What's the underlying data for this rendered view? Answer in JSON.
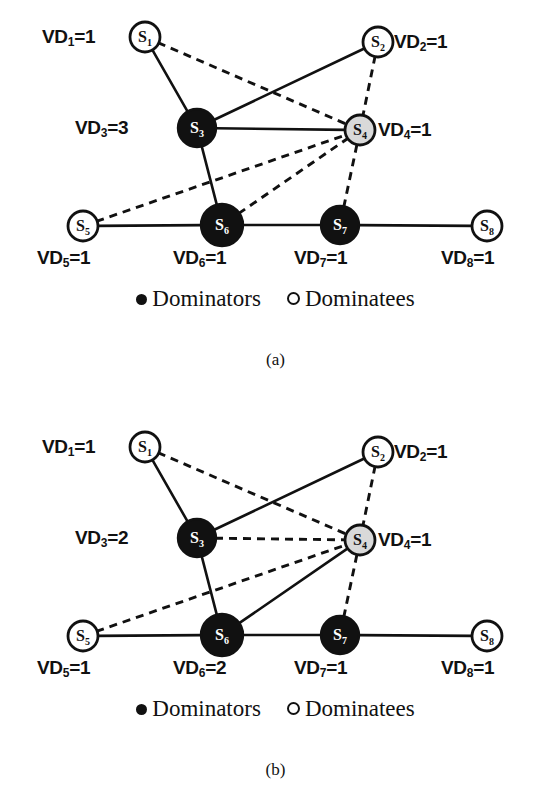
{
  "figure": {
    "panels": [
      {
        "id": "a",
        "caption": "(a)",
        "legend": {
          "dominators_label": "Dominators",
          "dominatees_label": "Dominatees"
        },
        "nodes": [
          {
            "id": "S1",
            "label": "S",
            "sub": "1",
            "kind": "dominatee",
            "cx": 145,
            "cy": 37,
            "r": 15,
            "vd_text": "VD",
            "vd_sub": "1",
            "vd_value": "=1",
            "vd_x": 42,
            "vd_y": 27,
            "vd_align": "left"
          },
          {
            "id": "S2",
            "label": "S",
            "sub": "2",
            "kind": "dominatee",
            "cx": 378,
            "cy": 42,
            "r": 15,
            "vd_text": "VD",
            "vd_sub": "2",
            "vd_value": "=1",
            "vd_x": 394,
            "vd_y": 32,
            "vd_align": "left"
          },
          {
            "id": "S3",
            "label": "S",
            "sub": "3",
            "kind": "dominator",
            "cx": 197,
            "cy": 128,
            "r": 19,
            "vd_text": "VD",
            "vd_sub": "3",
            "vd_value": "=3",
            "vd_x": 75,
            "vd_y": 118,
            "vd_align": "left"
          },
          {
            "id": "S4",
            "label": "S",
            "sub": "4",
            "kind": "gray",
            "cx": 360,
            "cy": 130,
            "r": 15,
            "vd_text": "VD",
            "vd_sub": "4",
            "vd_value": "=1",
            "vd_x": 378,
            "vd_y": 120,
            "vd_align": "left"
          },
          {
            "id": "S5",
            "label": "S",
            "sub": "5",
            "kind": "dominatee",
            "cx": 83,
            "cy": 226,
            "r": 15,
            "vd_text": "VD",
            "vd_sub": "5",
            "vd_value": "=1",
            "vd_x": 37,
            "vd_y": 248,
            "vd_align": "left"
          },
          {
            "id": "S6",
            "label": "S",
            "sub": "6",
            "kind": "dominator",
            "cx": 222,
            "cy": 225,
            "r": 21,
            "vd_text": "VD",
            "vd_sub": "6",
            "vd_value": "=1",
            "vd_x": 173,
            "vd_y": 248,
            "vd_align": "left"
          },
          {
            "id": "S7",
            "label": "S",
            "sub": "7",
            "kind": "dominator",
            "cx": 340,
            "cy": 225,
            "r": 19,
            "vd_text": "VD",
            "vd_sub": "7",
            "vd_value": "=1",
            "vd_x": 294,
            "vd_y": 248,
            "vd_align": "left"
          },
          {
            "id": "S8",
            "label": "S",
            "sub": "8",
            "kind": "dominatee",
            "cx": 487,
            "cy": 226,
            "r": 15,
            "vd_text": "VD",
            "vd_sub": "8",
            "vd_value": "=1",
            "vd_x": 441,
            "vd_y": 248,
            "vd_align": "left"
          }
        ],
        "edges": [
          {
            "from": "S1",
            "to": "S3",
            "style": "solid"
          },
          {
            "from": "S1",
            "to": "S4",
            "style": "dashed"
          },
          {
            "from": "S2",
            "to": "S3",
            "style": "solid"
          },
          {
            "from": "S2",
            "to": "S4",
            "style": "dashed"
          },
          {
            "from": "S3",
            "to": "S4",
            "style": "solid"
          },
          {
            "from": "S3",
            "to": "S6",
            "style": "solid"
          },
          {
            "from": "S5",
            "to": "S4",
            "style": "dashed"
          },
          {
            "from": "S5",
            "to": "S6",
            "style": "solid"
          },
          {
            "from": "S6",
            "to": "S4",
            "style": "dashed"
          },
          {
            "from": "S6",
            "to": "S7",
            "style": "solid"
          },
          {
            "from": "S7",
            "to": "S4",
            "style": "dashed"
          },
          {
            "from": "S7",
            "to": "S8",
            "style": "solid"
          }
        ],
        "legend_y": 284,
        "caption_y": 350
      },
      {
        "id": "b",
        "caption": "(b)",
        "legend": {
          "dominators_label": "Dominators",
          "dominatees_label": "Dominatees"
        },
        "nodes": [
          {
            "id": "S1",
            "label": "S",
            "sub": "1",
            "kind": "dominatee",
            "cx": 145,
            "cy": 447,
            "r": 15,
            "vd_text": "VD",
            "vd_sub": "1",
            "vd_value": "=1",
            "vd_x": 42,
            "vd_y": 437,
            "vd_align": "left"
          },
          {
            "id": "S2",
            "label": "S",
            "sub": "2",
            "kind": "dominatee",
            "cx": 378,
            "cy": 452,
            "r": 15,
            "vd_text": "VD",
            "vd_sub": "2",
            "vd_value": "=1",
            "vd_x": 394,
            "vd_y": 442,
            "vd_align": "left"
          },
          {
            "id": "S3",
            "label": "S",
            "sub": "3",
            "kind": "dominator",
            "cx": 197,
            "cy": 538,
            "r": 19,
            "vd_text": "VD",
            "vd_sub": "3",
            "vd_value": "=2",
            "vd_x": 75,
            "vd_y": 528,
            "vd_align": "left"
          },
          {
            "id": "S4",
            "label": "S",
            "sub": "4",
            "kind": "gray",
            "cx": 360,
            "cy": 540,
            "r": 15,
            "vd_text": "VD",
            "vd_sub": "4",
            "vd_value": "=1",
            "vd_x": 378,
            "vd_y": 530,
            "vd_align": "left"
          },
          {
            "id": "S5",
            "label": "S",
            "sub": "5",
            "kind": "dominatee",
            "cx": 83,
            "cy": 636,
            "r": 15,
            "vd_text": "VD",
            "vd_sub": "5",
            "vd_value": "=1",
            "vd_x": 37,
            "vd_y": 658,
            "vd_align": "left"
          },
          {
            "id": "S6",
            "label": "S",
            "sub": "6",
            "kind": "dominator",
            "cx": 222,
            "cy": 635,
            "r": 21,
            "vd_text": "VD",
            "vd_sub": "6",
            "vd_value": "=2",
            "vd_x": 173,
            "vd_y": 658,
            "vd_align": "left"
          },
          {
            "id": "S7",
            "label": "S",
            "sub": "7",
            "kind": "dominator",
            "cx": 340,
            "cy": 635,
            "r": 19,
            "vd_text": "VD",
            "vd_sub": "7",
            "vd_value": "=1",
            "vd_x": 294,
            "vd_y": 658,
            "vd_align": "left"
          },
          {
            "id": "S8",
            "label": "S",
            "sub": "8",
            "kind": "dominatee",
            "cx": 487,
            "cy": 636,
            "r": 15,
            "vd_text": "VD",
            "vd_sub": "8",
            "vd_value": "=1",
            "vd_x": 441,
            "vd_y": 658,
            "vd_align": "left"
          }
        ],
        "edges": [
          {
            "from": "S1",
            "to": "S3",
            "style": "solid"
          },
          {
            "from": "S1",
            "to": "S4",
            "style": "dashed"
          },
          {
            "from": "S2",
            "to": "S3",
            "style": "solid"
          },
          {
            "from": "S2",
            "to": "S4",
            "style": "dashed"
          },
          {
            "from": "S3",
            "to": "S4",
            "style": "dashed"
          },
          {
            "from": "S3",
            "to": "S6",
            "style": "solid"
          },
          {
            "from": "S5",
            "to": "S4",
            "style": "dashed"
          },
          {
            "from": "S5",
            "to": "S6",
            "style": "solid"
          },
          {
            "from": "S6",
            "to": "S4",
            "style": "solid"
          },
          {
            "from": "S6",
            "to": "S7",
            "style": "solid"
          },
          {
            "from": "S7",
            "to": "S4",
            "style": "dashed"
          },
          {
            "from": "S7",
            "to": "S8",
            "style": "solid"
          }
        ],
        "legend_y": 694,
        "caption_y": 760
      }
    ],
    "colors": {
      "dominator_fill": "#111111",
      "dominatee_fill": "#ffffff",
      "gray_node_fill": "#d9d9d9",
      "edge_color": "#111111",
      "background": "#ffffff"
    }
  }
}
